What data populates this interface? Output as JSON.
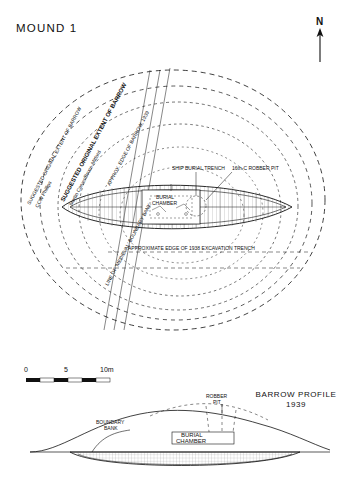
{
  "page": {
    "title": "MOUND 1",
    "north_label": "N"
  },
  "scale_bar": {
    "ticks": [
      "0",
      "5",
      "10m"
    ],
    "unit": "m"
  },
  "plan_labels": {
    "suggested_original_extent_ccw": "SUGGESTED ORIGINAL EXTENT OF BARROW",
    "suggested_original_extent_ccw_sub": "CCW Phillips",
    "suggested_original_extent_mb": "SUGGESTED ORIGINAL EXTENT OF BARROW",
    "suggested_original_extent_mb_sub": "Martin Carver/Bruce-Mitford",
    "approx_edge_1939": "APPROX. EDGE OF BARROW, 1939",
    "ship_burial_trench": "SHIP BURIAL TRENCH",
    "robber_pit": "16th-C ROBBER PIT",
    "burial_chamber": "BURIAL CHAMBER",
    "approx_edge_excavation": "APPROXIMATE EDGE OF 1938 EXCAVATION TRENCH",
    "line_of_medieval_boundary": "LINE OF 'MEDIEVAL' BOUNDARY BANK"
  },
  "profile": {
    "title_line1": "BARROW PROFILE",
    "title_line2": "1939",
    "boundary_bank": "BOUNDARY\nBANK",
    "boundary_bank_l1": "BOUNDARY",
    "boundary_bank_l2": "BANK",
    "robber_pit_l1": "ROBBER",
    "robber_pit_l2": "PIT",
    "burial_chamber_l1": "BURIAL",
    "burial_chamber_l2": "CHAMBER"
  },
  "colors": {
    "ink": "#111111",
    "hatch": "#555555",
    "paper": "#ffffff"
  }
}
